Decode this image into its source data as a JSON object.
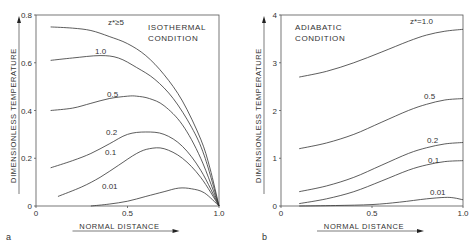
{
  "chart_data": [
    {
      "panel": "a",
      "type": "line",
      "title": "ISOTHERMAL CONDITION",
      "title_lines": [
        "ISOTHERMAL",
        "CONDITION"
      ],
      "xlabel": "NORMAL DISTANCE",
      "ylabel": "DIMENSIONLESS TEMPERATURE",
      "xlim": [
        0,
        1.0
      ],
      "ylim": [
        0,
        0.8
      ],
      "xticks": [
        "0",
        "0.5",
        "1.0"
      ],
      "yticks": [
        "0",
        "0.2",
        "0.4",
        "0.6",
        "0.8"
      ],
      "grid": false,
      "series": [
        {
          "name": "z*≥5",
          "label": "z*≥5",
          "x": [
            0.08,
            0.2,
            0.3,
            0.4,
            0.5,
            0.6,
            0.7,
            0.8,
            0.9,
            0.95,
            1.0
          ],
          "y": [
            0.75,
            0.745,
            0.735,
            0.71,
            0.68,
            0.63,
            0.55,
            0.44,
            0.28,
            0.16,
            0.0
          ]
        },
        {
          "name": "1.0",
          "label": "1.0",
          "x": [
            0.08,
            0.2,
            0.35,
            0.45,
            0.55,
            0.65,
            0.75,
            0.85,
            0.92,
            1.0
          ],
          "y": [
            0.61,
            0.62,
            0.63,
            0.62,
            0.58,
            0.53,
            0.45,
            0.33,
            0.21,
            0.0
          ]
        },
        {
          "name": "0.5",
          "label": "0.5",
          "x": [
            0.08,
            0.2,
            0.3,
            0.4,
            0.5,
            0.55,
            0.62,
            0.7,
            0.8,
            0.9,
            1.0
          ],
          "y": [
            0.4,
            0.41,
            0.43,
            0.45,
            0.46,
            0.46,
            0.45,
            0.42,
            0.34,
            0.2,
            0.0
          ]
        },
        {
          "name": "0.2",
          "label": "0.2",
          "x": [
            0.08,
            0.2,
            0.3,
            0.4,
            0.5,
            0.6,
            0.7,
            0.8,
            0.9,
            1.0
          ],
          "y": [
            0.16,
            0.19,
            0.22,
            0.26,
            0.3,
            0.31,
            0.3,
            0.25,
            0.15,
            0.0
          ]
        },
        {
          "name": "0.1",
          "label": "0.1",
          "x": [
            0.12,
            0.25,
            0.35,
            0.45,
            0.55,
            0.62,
            0.7,
            0.8,
            0.9,
            1.0
          ],
          "y": [
            0.04,
            0.08,
            0.12,
            0.17,
            0.22,
            0.24,
            0.24,
            0.2,
            0.12,
            0.0
          ]
        },
        {
          "name": "0.01",
          "label": "0.01",
          "x": [
            0.3,
            0.4,
            0.5,
            0.6,
            0.7,
            0.78,
            0.85,
            0.92,
            1.0
          ],
          "y": [
            0.0,
            0.008,
            0.02,
            0.04,
            0.06,
            0.075,
            0.072,
            0.055,
            0.0
          ]
        }
      ]
    },
    {
      "panel": "b",
      "type": "line",
      "title": "ADIABATIC CONDITION",
      "title_lines": [
        "ADIABATIC",
        "CONDITION"
      ],
      "xlabel": "NORMAL DISTANCE",
      "ylabel": "DIMENSIONLESS TEMPERATURE",
      "xlim": [
        0,
        1.0
      ],
      "ylim": [
        0,
        4
      ],
      "xticks": [
        "0",
        "0.5",
        "1.0"
      ],
      "yticks": [
        "0",
        "1",
        "2",
        "3",
        "4"
      ],
      "grid": false,
      "series": [
        {
          "name": "z*=1.0",
          "label": "z*=1.0",
          "x": [
            0.1,
            0.25,
            0.4,
            0.55,
            0.7,
            0.8,
            0.9,
            1.0
          ],
          "y": [
            2.7,
            2.82,
            3.0,
            3.22,
            3.45,
            3.58,
            3.66,
            3.7
          ]
        },
        {
          "name": "0.5",
          "label": "0.5",
          "x": [
            0.1,
            0.25,
            0.4,
            0.55,
            0.7,
            0.8,
            0.9,
            1.0
          ],
          "y": [
            1.2,
            1.32,
            1.5,
            1.75,
            2.0,
            2.13,
            2.22,
            2.25
          ]
        },
        {
          "name": "0.2",
          "label": "0.2",
          "x": [
            0.1,
            0.25,
            0.4,
            0.55,
            0.7,
            0.8,
            0.9,
            1.0
          ],
          "y": [
            0.3,
            0.42,
            0.6,
            0.85,
            1.1,
            1.22,
            1.3,
            1.33
          ]
        },
        {
          "name": "0.1",
          "label": "0.1",
          "x": [
            0.1,
            0.25,
            0.4,
            0.55,
            0.7,
            0.8,
            0.9,
            1.0
          ],
          "y": [
            0.05,
            0.15,
            0.3,
            0.52,
            0.75,
            0.86,
            0.93,
            0.95
          ]
        },
        {
          "name": "0.01",
          "label": "0.01",
          "x": [
            0.1,
            0.3,
            0.5,
            0.65,
            0.8,
            0.9,
            0.95,
            1.0
          ],
          "y": [
            0.0,
            0.01,
            0.03,
            0.08,
            0.15,
            0.18,
            0.17,
            0.13
          ]
        }
      ]
    }
  ]
}
